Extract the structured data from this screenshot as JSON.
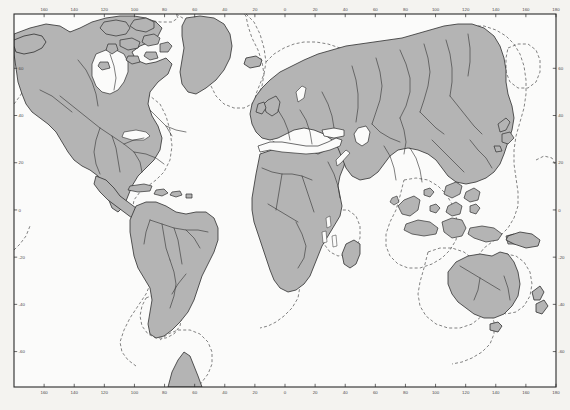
{
  "figure": {
    "projection": "equirectangular",
    "background_color": "#f4f3f0",
    "border_color": "#2b2b2b",
    "land_fill": "#b4b4b4",
    "coast_stroke": "#2e2e2e",
    "river_stroke": "#3a3a3a",
    "shelf_stroke": "#555555",
    "shelf_style": "dashed",
    "inland_water_fill": "#fbfbfa"
  },
  "plot_area": {
    "left": 14,
    "top": 14,
    "right": 556,
    "bottom": 387,
    "lon_min": -180,
    "lon_max": 180,
    "lat_min": -75,
    "lat_max": 83
  },
  "axes": {
    "x_ticks": [
      {
        "value": -160,
        "label": "160"
      },
      {
        "value": -140,
        "label": "140"
      },
      {
        "value": -120,
        "label": "120"
      },
      {
        "value": -100,
        "label": "100"
      },
      {
        "value": -80,
        "label": "80"
      },
      {
        "value": -60,
        "label": "60"
      },
      {
        "value": -40,
        "label": "40"
      },
      {
        "value": -20,
        "label": "20"
      },
      {
        "value": 0,
        "label": "0"
      },
      {
        "value": 20,
        "label": "20"
      },
      {
        "value": 40,
        "label": "40"
      },
      {
        "value": 60,
        "label": "60"
      },
      {
        "value": 80,
        "label": "80"
      },
      {
        "value": 100,
        "label": "100"
      },
      {
        "value": 120,
        "label": "120"
      },
      {
        "value": 140,
        "label": "140"
      },
      {
        "value": 160,
        "label": "160"
      },
      {
        "value": 180,
        "label": "180"
      }
    ],
    "y_ticks": [
      {
        "value": 60,
        "label": "60"
      },
      {
        "value": 40,
        "label": "40"
      },
      {
        "value": 20,
        "label": "20"
      },
      {
        "value": 0,
        "label": "0"
      },
      {
        "value": -20,
        "label": "-20"
      },
      {
        "value": -40,
        "label": "-40"
      },
      {
        "value": -60,
        "label": "-60"
      }
    ]
  },
  "chart_data": {
    "type": "map",
    "xlabel": "",
    "ylabel": "",
    "xlim": [
      -180,
      180
    ],
    "ylim": [
      -75,
      83
    ],
    "grid": false,
    "legend": "none",
    "features": [
      {
        "name": "north-america",
        "type": "landmass"
      },
      {
        "name": "greenland",
        "type": "landmass"
      },
      {
        "name": "south-america",
        "type": "landmass"
      },
      {
        "name": "africa",
        "type": "landmass"
      },
      {
        "name": "eurasia",
        "type": "landmass"
      },
      {
        "name": "australia",
        "type": "landmass"
      },
      {
        "name": "antarctic-peninsula",
        "type": "landmass"
      },
      {
        "name": "madagascar",
        "type": "island"
      },
      {
        "name": "new-zealand",
        "type": "island"
      },
      {
        "name": "japan",
        "type": "island"
      },
      {
        "name": "indonesia",
        "type": "archipelago"
      },
      {
        "name": "philippines",
        "type": "archipelago"
      },
      {
        "name": "caribbean",
        "type": "archipelago"
      },
      {
        "name": "british-isles",
        "type": "archipelago"
      },
      {
        "name": "canadian-arctic",
        "type": "archipelago"
      },
      {
        "name": "continental-shelf",
        "type": "dashed-contour"
      },
      {
        "name": "rivers",
        "type": "line-network"
      },
      {
        "name": "mediterranean-sea",
        "type": "inland-water"
      },
      {
        "name": "black-sea",
        "type": "inland-water"
      },
      {
        "name": "red-sea",
        "type": "inland-water"
      },
      {
        "name": "great-lakes",
        "type": "inland-water"
      },
      {
        "name": "hudson-bay",
        "type": "inland-water"
      },
      {
        "name": "caspian-sea",
        "type": "inland-water"
      },
      {
        "name": "african-rift-lakes",
        "type": "inland-water"
      }
    ]
  }
}
